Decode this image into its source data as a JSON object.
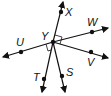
{
  "diagram": {
    "center": {
      "label": "Y",
      "x": 53,
      "y": 42
    },
    "points": [
      {
        "label": "X",
        "x": 61,
        "y": 12,
        "lx": 65,
        "ly": 16
      },
      {
        "label": "W",
        "x": 92,
        "y": 32,
        "lx": 87,
        "ly": 26
      },
      {
        "label": "V",
        "x": 91,
        "y": 52,
        "lx": 87,
        "ly": 66
      },
      {
        "label": "U",
        "x": 21,
        "y": 52,
        "lx": 16,
        "ly": 46
      },
      {
        "label": "T",
        "x": 44,
        "y": 79,
        "lx": 33,
        "ly": 81
      },
      {
        "label": "S",
        "x": 62,
        "y": 76,
        "lx": 66,
        "ly": 76
      }
    ],
    "right_angle_marks": 2,
    "colors": {
      "stroke": "#111111",
      "background": "#ffffff"
    }
  },
  "labels": {
    "X": "X",
    "W": "W",
    "V": "V",
    "U": "U",
    "T": "T",
    "S": "S",
    "Y": "Y"
  }
}
